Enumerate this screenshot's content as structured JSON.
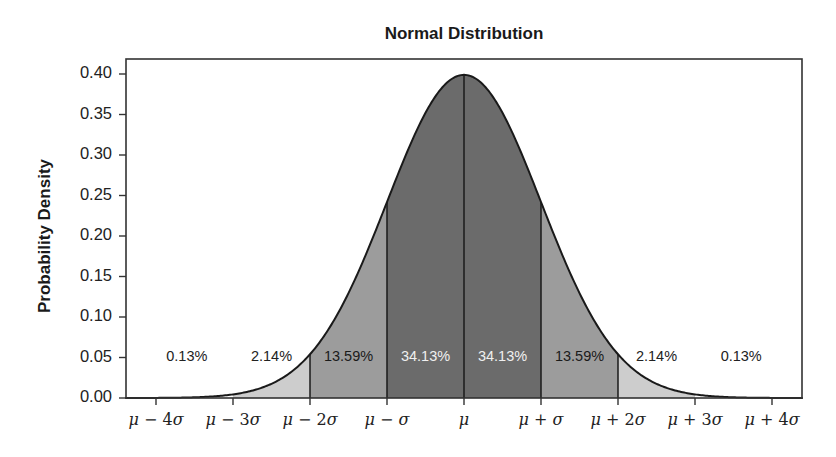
{
  "chart_data": {
    "type": "area",
    "title": "Normal Distribution",
    "xlabel": "",
    "ylabel": "Probability Density",
    "ylim": [
      0.0,
      0.4
    ],
    "xlim_sigma": [
      -4.4,
      4.4
    ],
    "grid": false,
    "legend": null,
    "y_ticks": [
      "0.00",
      "0.05",
      "0.10",
      "0.15",
      "0.20",
      "0.25",
      "0.30",
      "0.35",
      "0.40"
    ],
    "x_ticks": [
      {
        "z": -4,
        "label_mu": "μ",
        "label_op": " − ",
        "label_k": "4",
        "label_sig": "σ"
      },
      {
        "z": -3,
        "label_mu": "μ",
        "label_op": " − ",
        "label_k": "3",
        "label_sig": "σ"
      },
      {
        "z": -2,
        "label_mu": "μ",
        "label_op": " − ",
        "label_k": "2",
        "label_sig": "σ"
      },
      {
        "z": -1,
        "label_mu": "μ",
        "label_op": " − ",
        "label_k": "",
        "label_sig": "σ"
      },
      {
        "z": 0,
        "label_mu": "μ",
        "label_op": "",
        "label_k": "",
        "label_sig": ""
      },
      {
        "z": 1,
        "label_mu": "μ",
        "label_op": " + ",
        "label_k": "",
        "label_sig": "σ"
      },
      {
        "z": 2,
        "label_mu": "μ",
        "label_op": " + ",
        "label_k": "2",
        "label_sig": "σ"
      },
      {
        "z": 3,
        "label_mu": "μ",
        "label_op": " + ",
        "label_k": "3",
        "label_sig": "σ"
      },
      {
        "z": 4,
        "label_mu": "μ",
        "label_op": " + ",
        "label_k": "4",
        "label_sig": "σ"
      }
    ],
    "curve": {
      "description": "Standard normal probability density function",
      "peak": {
        "z": 0,
        "density": 0.399
      }
    },
    "regions": [
      {
        "from": -4.4,
        "to": -3,
        "percent": "0.13%",
        "value": 0.13,
        "fill": "#ffffff",
        "label_color": "#222222",
        "label_z": -3.6
      },
      {
        "from": -3,
        "to": -2,
        "percent": "2.14%",
        "value": 2.14,
        "fill": "#cdcdcd",
        "label_color": "#222222",
        "label_z": -2.5
      },
      {
        "from": -2,
        "to": -1,
        "percent": "13.59%",
        "value": 13.59,
        "fill": "#9c9c9c",
        "label_color": "#1a1a1a",
        "label_z": -1.5
      },
      {
        "from": -1,
        "to": 0,
        "percent": "34.13%",
        "value": 34.13,
        "fill": "#6b6b6b",
        "label_color": "#f0f0f0",
        "label_z": -0.5
      },
      {
        "from": 0,
        "to": 1,
        "percent": "34.13%",
        "value": 34.13,
        "fill": "#6b6b6b",
        "label_color": "#f0f0f0",
        "label_z": 0.5
      },
      {
        "from": 1,
        "to": 2,
        "percent": "13.59%",
        "value": 13.59,
        "fill": "#9c9c9c",
        "label_color": "#1a1a1a",
        "label_z": 1.5
      },
      {
        "from": 2,
        "to": 3,
        "percent": "2.14%",
        "value": 2.14,
        "fill": "#cdcdcd",
        "label_color": "#222222",
        "label_z": 2.5
      },
      {
        "from": 3,
        "to": 4.4,
        "percent": "0.13%",
        "value": 0.13,
        "fill": "#ffffff",
        "label_color": "#222222",
        "label_z": 3.6
      }
    ],
    "region_label_density": 0.05,
    "divider_lines_at_z": [
      -2,
      -1,
      0,
      1,
      2
    ]
  }
}
